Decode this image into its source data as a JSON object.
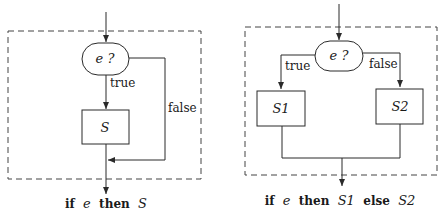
{
  "diagrams": [
    {
      "id": "if-then",
      "condition": "e ?",
      "true_label": "true",
      "false_label": "false",
      "statement": "S",
      "caption": {
        "kw_if": "if",
        "expr": "e",
        "kw_then": "then",
        "stmt": "S"
      }
    },
    {
      "id": "if-then-else",
      "condition": "e ?",
      "true_label": "true",
      "false_label": "false",
      "statement_true": "S1",
      "statement_false": "S2",
      "caption": {
        "kw_if": "if",
        "expr": "e",
        "kw_then": "then",
        "stmt_true": "S1",
        "kw_else": "else",
        "stmt_false": "S2"
      }
    }
  ],
  "colors": {
    "stroke": "#2a2a2a",
    "dashed_border": "#444444",
    "background": "#ffffff"
  }
}
